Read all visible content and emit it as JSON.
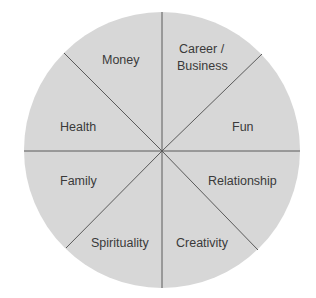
{
  "diagram": {
    "type": "wheel",
    "fill_color": "#d7d7d7",
    "line_color": "#5a5a5a",
    "segments": [
      {
        "label_lines": [
          "Money"
        ]
      },
      {
        "label_lines": [
          "Career /",
          "Business"
        ]
      },
      {
        "label_lines": [
          "Fun"
        ]
      },
      {
        "label_lines": [
          "Relationship"
        ]
      },
      {
        "label_lines": [
          "Creativity"
        ]
      },
      {
        "label_lines": [
          "Spirituality"
        ]
      },
      {
        "label_lines": [
          "Family"
        ]
      },
      {
        "label_lines": [
          "Health"
        ]
      }
    ]
  }
}
